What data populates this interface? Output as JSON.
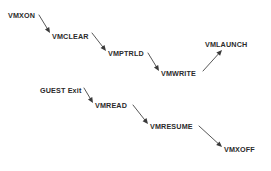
{
  "diagram": {
    "background_color": "#ffffff",
    "text_color": "#2b2b2b",
    "arrow_color": "#3a3a3a",
    "nodes": [
      {
        "id": "vmxon",
        "label": "VMXON",
        "x": 8,
        "y": 11
      },
      {
        "id": "vmclear",
        "label": "VMCLEAR",
        "x": 52,
        "y": 32
      },
      {
        "id": "vmptrld",
        "label": "VMPTRLD",
        "x": 108,
        "y": 49
      },
      {
        "id": "vmwrite",
        "label": "VMWRITE",
        "x": 161,
        "y": 69
      },
      {
        "id": "vmlaunch",
        "label": "VMLAUNCH",
        "x": 205,
        "y": 40
      },
      {
        "id": "guestexit",
        "label": "GUEST Exit",
        "x": 40,
        "y": 86
      },
      {
        "id": "vmread",
        "label": "VMREAD",
        "x": 95,
        "y": 101
      },
      {
        "id": "vmresume",
        "label": "VMRESUME",
        "x": 150,
        "y": 122
      },
      {
        "id": "vmxoff",
        "label": "VMXOFF",
        "x": 224,
        "y": 145
      }
    ],
    "edges": [
      {
        "id": "vmxon-to-vmclear",
        "from": "vmxon",
        "to": "vmclear",
        "x1": 39,
        "y1": 15,
        "x2": 50,
        "y2": 33
      },
      {
        "id": "vmclear-to-vmptrld",
        "from": "vmclear",
        "to": "vmptrld",
        "x1": 92,
        "y1": 33,
        "x2": 106,
        "y2": 51
      },
      {
        "id": "vmptrld-to-vmwrite",
        "from": "vmptrld",
        "to": "vmwrite",
        "x1": 148,
        "y1": 53,
        "x2": 159,
        "y2": 71
      },
      {
        "id": "vmwrite-to-vmlaunch",
        "from": "vmwrite",
        "to": "vmlaunch",
        "x1": 203,
        "y1": 71,
        "x2": 222,
        "y2": 50
      },
      {
        "id": "guestexit-to-vmread",
        "from": "guestexit",
        "to": "vmread",
        "x1": 84,
        "y1": 88,
        "x2": 93,
        "y2": 103
      },
      {
        "id": "vmread-to-vmresume",
        "from": "vmread",
        "to": "vmresume",
        "x1": 133,
        "y1": 105,
        "x2": 148,
        "y2": 124
      },
      {
        "id": "vmresume-to-vmxoff",
        "from": "vmresume",
        "to": "vmxoff",
        "x1": 199,
        "y1": 126,
        "x2": 222,
        "y2": 147
      }
    ]
  }
}
